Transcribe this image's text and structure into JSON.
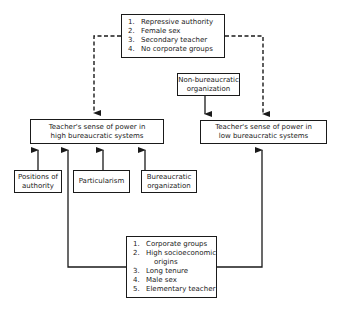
{
  "top_factors": {
    "items": [
      {
        "num": "1.",
        "text": "Repressive authority"
      },
      {
        "num": "2.",
        "text": "Female sex"
      },
      {
        "num": "3.",
        "text": "Secondary teacher"
      },
      {
        "num": "4.",
        "text": "No corporate groups"
      }
    ]
  },
  "non_bureaucratic": {
    "line1": "Non-bureaucratic",
    "line2": "organization"
  },
  "high_power": {
    "line1": "Teacher's sense of power in",
    "line2": "high bureaucratic systems"
  },
  "low_power": {
    "line1": "Teacher's sense of power in",
    "line2": "low bureaucratic systems"
  },
  "positions": {
    "line1": "Positions of",
    "line2": "authority"
  },
  "particularism": {
    "line1": "Particularism"
  },
  "bureaucratic": {
    "line1": "Bureaucratic",
    "line2": "organization"
  },
  "bottom_factors": {
    "items": [
      {
        "num": "1.",
        "text": "Corporate groups"
      },
      {
        "num": "2.",
        "text": "High socioeconomic"
      },
      {
        "num": "",
        "text": "origins",
        "continuation": true
      },
      {
        "num": "3.",
        "text": "Long tenure"
      },
      {
        "num": "4.",
        "text": "Male sex"
      },
      {
        "num": "5.",
        "text": "Elementary teacher"
      }
    ]
  },
  "colors": {
    "ink": "#1a1a1a",
    "background": "#ffffff"
  }
}
